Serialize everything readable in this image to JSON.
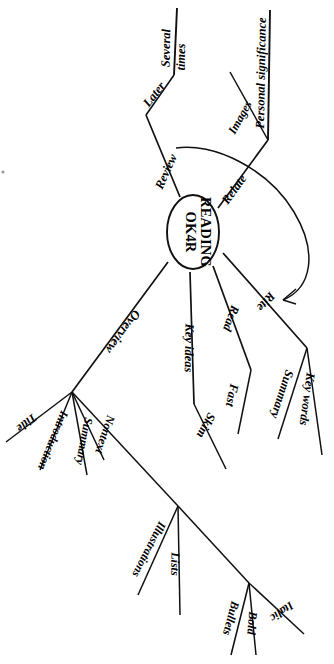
{
  "diagram": {
    "type": "mind-map",
    "title": "OK4R READING",
    "orientation": "rotated-90-clockwise",
    "background_color": "#ffffff",
    "line_color": "#111111",
    "text_color": "#000000",
    "center": {
      "label_line_1": "OK4R",
      "label_line_2": "READING",
      "shape": "ellipse"
    },
    "branches": [
      {
        "id": "overview",
        "label": "Overview",
        "children": [
          {
            "id": "title",
            "label": "Title",
            "children": []
          },
          {
            "id": "introduction",
            "label": "Introduction",
            "children": []
          },
          {
            "id": "summary-overview",
            "label": "Summary",
            "children": []
          },
          {
            "id": "nontext",
            "label": "Nontext",
            "children": [
              {
                "id": "illustrations",
                "label": "Illustrations",
                "children": []
              },
              {
                "id": "lists",
                "label": "Lists",
                "children": []
              },
              {
                "id": "emphasis",
                "label": "",
                "children": [
                  {
                    "id": "bullets",
                    "label": "Bullets",
                    "children": []
                  },
                  {
                    "id": "bold",
                    "label": "Bold",
                    "children": []
                  },
                  {
                    "id": "italic",
                    "label": "Italic",
                    "children": []
                  }
                ]
              }
            ]
          }
        ]
      },
      {
        "id": "key-ideas",
        "label": "Key ideas",
        "children": [
          {
            "id": "skim",
            "label": "Skim",
            "children": []
          }
        ]
      },
      {
        "id": "read",
        "label": "Read",
        "children": [
          {
            "id": "fast",
            "label": "Fast",
            "children": []
          }
        ]
      },
      {
        "id": "rite",
        "label": "Rite",
        "children": [
          {
            "id": "summary-rite",
            "label": "Summary",
            "children": []
          },
          {
            "id": "key-words",
            "label": "Key words",
            "children": []
          }
        ]
      },
      {
        "id": "relate",
        "label": "Relate",
        "children": [
          {
            "id": "images",
            "label": "Images",
            "children": []
          },
          {
            "id": "personal-significance",
            "label": "Personal significance",
            "children": []
          }
        ]
      },
      {
        "id": "review",
        "label": "Review",
        "children": [
          {
            "id": "later",
            "label": "Later",
            "children": [
              {
                "id": "several-times",
                "label": "Several times",
                "children": []
              }
            ]
          }
        ]
      }
    ],
    "connector_arrow": {
      "id": "review-to-rite-arrow",
      "from": "review",
      "to": "rite",
      "style": "curved-arrow"
    }
  },
  "labels": {
    "center_line1": "OK4R",
    "center_line2": "READING",
    "overview": "Overview",
    "title": "Title",
    "introduction": "Introduction",
    "summary_overview": "Summary",
    "nontext": "Nontext",
    "illustrations": "Illustrations",
    "lists": "Lists",
    "bullets": "Bullets",
    "bold": "Bold",
    "italic": "Italic",
    "key_ideas": "Key ideas",
    "skim": "Skim",
    "read": "Read",
    "fast": "Fast",
    "rite": "Rite",
    "summary_rite": "Summary",
    "key_words": "Key words",
    "relate": "Relate",
    "images": "Images",
    "personal_significance": "Personal significance",
    "review": "Review",
    "later": "Later",
    "several_times_line1": "Several",
    "several_times_line2": "times"
  }
}
